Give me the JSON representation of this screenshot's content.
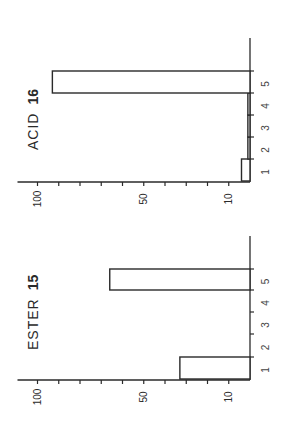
{
  "chart_data": [
    {
      "type": "bar",
      "orientation": "vertical (figure printed rotated 90° counter-clockwise)",
      "title": "ACID 16",
      "title_name": "ACID",
      "title_number": "16",
      "categories": [
        "1",
        "2",
        "3",
        "4",
        "5"
      ],
      "values": [
        4,
        1,
        1,
        1,
        93
      ],
      "xlabel": "",
      "ylabel": "",
      "ylim": [
        0,
        100
      ],
      "yticks": [
        100,
        90,
        80,
        70,
        60,
        50,
        40,
        30,
        20,
        10
      ],
      "ytick_labels": [
        "100",
        "50",
        "10"
      ],
      "grid": false,
      "legend": "none"
    },
    {
      "type": "bar",
      "orientation": "vertical (figure printed rotated 90° counter-clockwise)",
      "title": "ESTER 15",
      "title_name": "ESTER",
      "title_number": "15",
      "categories": [
        "1",
        "2",
        "3",
        "4",
        "5"
      ],
      "values": [
        33,
        0,
        0,
        0,
        66
      ],
      "xlabel": "",
      "ylabel": "",
      "ylim": [
        0,
        100
      ],
      "yticks": [
        100,
        90,
        80,
        70,
        60,
        50,
        40,
        30,
        20,
        10
      ],
      "ytick_labels": [
        "100",
        "50",
        "10"
      ],
      "grid": false,
      "legend": "none"
    }
  ]
}
